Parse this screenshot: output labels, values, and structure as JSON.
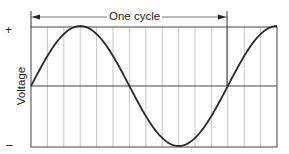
{
  "chart_data": {
    "type": "line",
    "title": "",
    "annotation": "One cycle",
    "xlabel": "",
    "ylabel": "Voltage",
    "y_tick_labels": [
      "+",
      "–"
    ],
    "grid": {
      "vertical": true,
      "horizontal": false,
      "vertical_divisions": 15
    },
    "axis_ranges": {
      "x": [
        0,
        450
      ],
      "y": [
        -1,
        1
      ]
    },
    "x_unit": "degrees",
    "series": [
      {
        "name": "sine wave",
        "x": [
          0,
          30,
          60,
          90,
          120,
          150,
          180,
          210,
          240,
          270,
          300,
          330,
          360,
          390,
          420,
          450
        ],
        "values": [
          0,
          0.5,
          0.87,
          1,
          0.87,
          0.5,
          0,
          -0.5,
          -0.87,
          -1,
          -0.87,
          -0.5,
          0,
          0.5,
          0.87,
          1
        ]
      }
    ],
    "cycle_span": [
      0,
      360
    ],
    "colors": {
      "curve": "#2a2a2a",
      "grid": "#c8c8c8",
      "axis": "#444444"
    }
  },
  "labels": {
    "cycle": "One cycle",
    "plus": "+",
    "minus": "–",
    "ylabel": "Voltage"
  }
}
